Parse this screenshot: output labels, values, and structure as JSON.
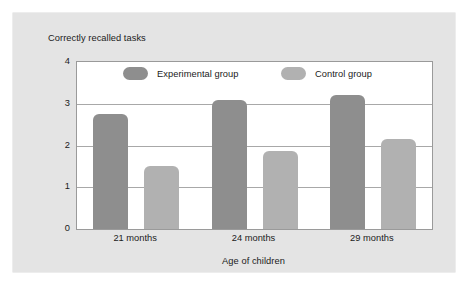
{
  "chart_data": {
    "type": "bar",
    "title": "Correctly recalled tasks",
    "xlabel": "Age of children",
    "ylabel": "",
    "categories": [
      "21 months",
      "24 months",
      "29 months"
    ],
    "series": [
      {
        "name": "Experimental group",
        "color": "#8e8e8e",
        "values": [
          2.75,
          3.1,
          3.2
        ]
      },
      {
        "name": "Control group",
        "color": "#b1b1b1",
        "values": [
          1.5,
          1.88,
          2.15
        ]
      }
    ],
    "ylim": [
      0,
      4
    ],
    "yticks": [
      "0",
      "1",
      "2",
      "3",
      "4"
    ],
    "ytick_values": [
      0,
      1,
      2,
      3,
      4
    ],
    "grid": true,
    "legend_position": "top-inside"
  },
  "colors": {
    "card_background": "#e4e4e4",
    "plot_background": "#ffffff",
    "gridline": "#a8a8a8",
    "axis": "#9a9a9a",
    "text": "#1b1b1b"
  }
}
